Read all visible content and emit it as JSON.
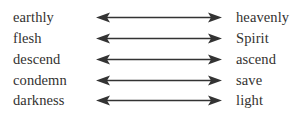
{
  "diagram": {
    "type": "paired-opposites",
    "arrow_style": "double-headed",
    "colors": {
      "background": "#ffffff",
      "text": "#33312f",
      "arrow": "#333333"
    },
    "rows": [
      {
        "left": "earthly",
        "right": "heavenly",
        "arrow": "double-headed-arrow"
      },
      {
        "left": "flesh",
        "right": "Spirit",
        "arrow": "double-headed-arrow"
      },
      {
        "left": "descend",
        "right": "ascend",
        "arrow": "double-headed-arrow"
      },
      {
        "left": "condemn",
        "right": "save",
        "arrow": "double-headed-arrow"
      },
      {
        "left": "darkness",
        "right": "light",
        "arrow": "double-headed-arrow"
      }
    ]
  }
}
